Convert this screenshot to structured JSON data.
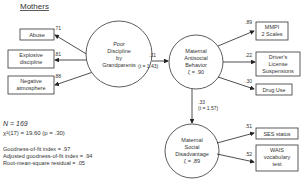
{
  "title": "Mothers",
  "latent": {
    "poor_discipline": [
      "Poor",
      "Discipline",
      "by",
      "Grandparents"
    ],
    "antisocial": [
      "Maternal",
      "Antisocial",
      "Behavior",
      "ζ = .90"
    ],
    "disadvantage": [
      "Maternal",
      "Social",
      "Disadvantage",
      "ζ = .89"
    ]
  },
  "indicators": {
    "abuse": {
      "label": [
        "Abuse"
      ],
      "loading": ".71"
    },
    "explosive": {
      "label": [
        "Explosive",
        "discipline"
      ],
      "loading": ".81"
    },
    "negative": {
      "label": [
        "Negative",
        "atmosphere"
      ],
      "loading": ".88"
    },
    "mmpi": {
      "label": [
        "MMPI",
        "2 Scales"
      ],
      "loading": ".89"
    },
    "license": {
      "label": [
        "Driver's",
        "License",
        "Suspensions"
      ],
      "loading": ".22"
    },
    "drug": {
      "label": [
        "Drug Use"
      ],
      "loading": ".30"
    },
    "ses": {
      "label": [
        "SES status"
      ],
      "loading": ".51"
    },
    "wais": {
      "label": [
        "WAIS",
        "vocabulary",
        "test"
      ],
      "loading": ".52"
    }
  },
  "paths": {
    "pd_to_asb": {
      "coef": ".31",
      "t": "(t = 1.43)"
    },
    "asb_to_msd": {
      "coef": ".33",
      "t": "(t = 1.57)"
    }
  },
  "stats": {
    "n": "N = 169",
    "chi": "χ²(17) = 19.60 (p = .30)",
    "gfi": "Goodness-of-fit index = .97",
    "agfi": "Adjusted goodness-of-fit index = .94",
    "rmsr": "Root-mean-square residual = .05"
  }
}
